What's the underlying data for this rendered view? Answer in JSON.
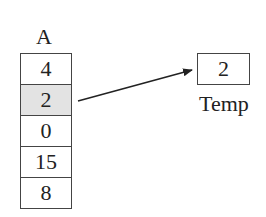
{
  "array": {
    "label": "A",
    "cells": [
      {
        "value": "4",
        "highlighted": false
      },
      {
        "value": "2",
        "highlighted": true
      },
      {
        "value": "0",
        "highlighted": false
      },
      {
        "value": "15",
        "highlighted": false
      },
      {
        "value": "8",
        "highlighted": false
      }
    ]
  },
  "temp": {
    "label": "Temp",
    "value": "2"
  },
  "arrow": {
    "from": "array.cells.1",
    "to": "temp",
    "icon": "arrow-right-icon"
  },
  "colors": {
    "border": "#444444",
    "highlight": "#e3e3e3",
    "text": "#222222"
  }
}
